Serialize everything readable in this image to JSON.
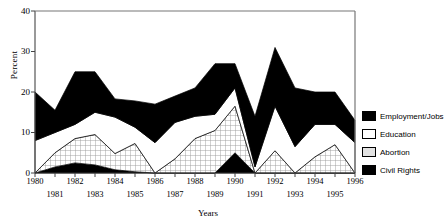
{
  "chart_data": {
    "type": "area",
    "stacked": true,
    "title": "",
    "xlabel": "Years",
    "ylabel": "Percent",
    "ylim": [
      0,
      40
    ],
    "yticks": [
      0,
      10,
      20,
      30,
      40
    ],
    "grid": false,
    "legend_position": "right",
    "categories": [
      1980,
      1981,
      1982,
      1983,
      1984,
      1985,
      1986,
      1987,
      1988,
      1989,
      1990,
      1991,
      1992,
      1993,
      1994,
      1995,
      1996
    ],
    "x": [
      "1980",
      "1981",
      "1982",
      "1983",
      "1984",
      "1985",
      "1986",
      "1987",
      "1988",
      "1989",
      "1990",
      "1991",
      "1992",
      "1993",
      "1994",
      "1995",
      "1996"
    ],
    "xticks_top": [
      "1980",
      "1982",
      "1984",
      "1986",
      "1988",
      "1990",
      "1992",
      "1994",
      "1996"
    ],
    "xticks_bottom": [
      "1981",
      "1983",
      "1985",
      "1987",
      "1989",
      "1991",
      "1993",
      "1995"
    ],
    "series": [
      {
        "name": "Civil Rights",
        "color": "#000000",
        "values": [
          0,
          1.5,
          2.5,
          2.0,
          0.8,
          0.3,
          0,
          0,
          0,
          0,
          5.0,
          0,
          0,
          0,
          0,
          0,
          0
        ]
      },
      {
        "name": "Abortion",
        "color": "#d9d9d9",
        "values": [
          0,
          3.5,
          6.0,
          7.5,
          4.0,
          7.0,
          0,
          3.5,
          8.5,
          10.5,
          11.5,
          0,
          5.5,
          0,
          4.0,
          7.0,
          0
        ]
      },
      {
        "name": "Education",
        "color": "#ffffff",
        "values": [
          8.0,
          5.0,
          3.5,
          5.5,
          9.0,
          4.0,
          7.5,
          9.0,
          5.5,
          4.0,
          4.5,
          1.5,
          11.0,
          6.5,
          8.0,
          5.0,
          7.5
        ]
      },
      {
        "name": "Employment/Jobs",
        "color": "#000000",
        "values": [
          12.0,
          5.5,
          13.0,
          10.0,
          4.5,
          6.5,
          9.5,
          6.5,
          7.0,
          12.5,
          6.0,
          12.5,
          14.5,
          14.5,
          8.0,
          8.0,
          5.5
        ]
      }
    ],
    "totals": [
      20.0,
      15.5,
      25.0,
      25.0,
      18.3,
      17.8,
      17.0,
      19.0,
      21.0,
      27.0,
      27.0,
      14.0,
      31.0,
      21.0,
      20.0,
      20.0,
      13.0
    ]
  },
  "axis": {
    "y_label": "Percent",
    "x_label": "Years"
  },
  "legend": {
    "items": [
      {
        "label": "Employment/Jobs",
        "swatch": "solid-black"
      },
      {
        "label": "Education",
        "swatch": "white"
      },
      {
        "label": "Abortion",
        "swatch": "light-grid"
      },
      {
        "label": "Civil Rights",
        "swatch": "solid-black"
      }
    ]
  }
}
